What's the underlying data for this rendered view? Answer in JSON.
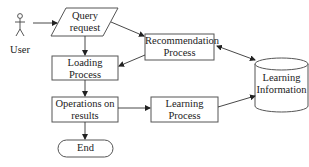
{
  "diagram": {
    "actor": {
      "label": "User",
      "icon": "stick-figure-icon"
    },
    "nodes": {
      "query": {
        "line1": "Query",
        "line2": "request",
        "shape": "parallelogram"
      },
      "recommendation": {
        "line1": "Recommendation",
        "line2": "Process",
        "shape": "rectangle"
      },
      "loading": {
        "line1": "Loading",
        "line2": "Process",
        "shape": "rectangle"
      },
      "learning_info": {
        "line1": "Learning",
        "line2": "Information",
        "shape": "cylinder"
      },
      "operations": {
        "line1": "Operations on",
        "line2": "results",
        "shape": "rectangle"
      },
      "learning_process": {
        "line1": "Learning",
        "line2": "Process",
        "shape": "rectangle"
      },
      "end": {
        "label": "End",
        "shape": "terminator"
      }
    },
    "edges": [
      {
        "from": "User",
        "to": "Query request",
        "direction": "forward"
      },
      {
        "from": "Query request",
        "to": "Recommendation Process",
        "direction": "forward"
      },
      {
        "from": "Query request",
        "to": "Loading Process",
        "direction": "forward"
      },
      {
        "from": "Recommendation Process",
        "to": "Loading Process",
        "direction": "forward"
      },
      {
        "from": "Recommendation Process",
        "to": "Learning Information",
        "direction": "bidirectional"
      },
      {
        "from": "Loading Process",
        "to": "Operations on results",
        "direction": "forward"
      },
      {
        "from": "Operations on results",
        "to": "Learning Process",
        "direction": "forward"
      },
      {
        "from": "Learning Process",
        "to": "Learning Information",
        "direction": "forward"
      },
      {
        "from": "Operations on results",
        "to": "End",
        "direction": "forward"
      }
    ],
    "colors": {
      "stroke": "#555555",
      "text": "#222222",
      "background": "#ffffff"
    }
  }
}
